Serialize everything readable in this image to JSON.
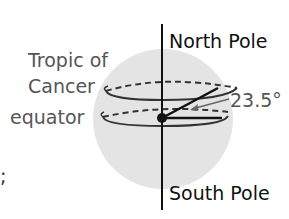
{
  "diagram": {
    "labels": {
      "north_pole": "North Pole",
      "south_pole": "South Pole",
      "tropic_line1": "Tropic of",
      "tropic_line2": "Cancer",
      "equator": "equator",
      "angle": "23.5°",
      "stray_mark": ";"
    },
    "colors": {
      "sphere_fill": "#e4e4e4",
      "line": "#111111",
      "label_gray": "#555555",
      "label_dark": "#111111",
      "arrow_gray": "#666666"
    }
  }
}
